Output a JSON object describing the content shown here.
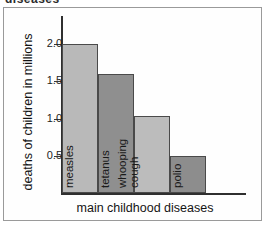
{
  "clipped_heading": "diseases",
  "chart_data": {
    "type": "bar",
    "title": "",
    "xlabel": "main childhood diseases",
    "ylabel": "deaths of children in millions",
    "categories": [
      "measles",
      "tetanus",
      "whooping cough",
      "polio"
    ],
    "values": [
      2.0,
      1.6,
      1.03,
      0.5
    ],
    "ylim": [
      0,
      2.4
    ],
    "yticks": [
      0.5,
      1.0,
      1.5,
      2.0
    ],
    "ytick_labels": [
      "0.5",
      "1.0",
      "1.5",
      "2.0"
    ],
    "grid": false,
    "legend": null,
    "bar_colors": [
      "#b9b9b9",
      "#8f8f8f",
      "#bcbcbc",
      "#8d8d8d"
    ],
    "bar_border_color": "#4a4a4a",
    "axis_color": "#2f2f2f",
    "label_rotation": -90
  },
  "bars": [
    {
      "label": "measles",
      "value": 2.0,
      "color": "#b9b9b9",
      "label_lines": [
        "measles"
      ]
    },
    {
      "label": "tetanus",
      "value": 1.6,
      "color": "#8f8f8f",
      "label_lines": [
        "tetanus"
      ]
    },
    {
      "label": "whooping cough",
      "value": 1.03,
      "color": "#bcbcbc",
      "label_lines": [
        "whooping",
        "cough"
      ]
    },
    {
      "label": "polio",
      "value": 0.5,
      "color": "#8d8d8d",
      "label_lines": [
        "polio"
      ]
    }
  ],
  "yticks": [
    {
      "label": "2.0",
      "value": 2.0
    },
    {
      "label": "1.5",
      "value": 1.5
    },
    {
      "label": "1.0",
      "value": 1.0
    },
    {
      "label": "0.5",
      "value": 0.5
    }
  ]
}
